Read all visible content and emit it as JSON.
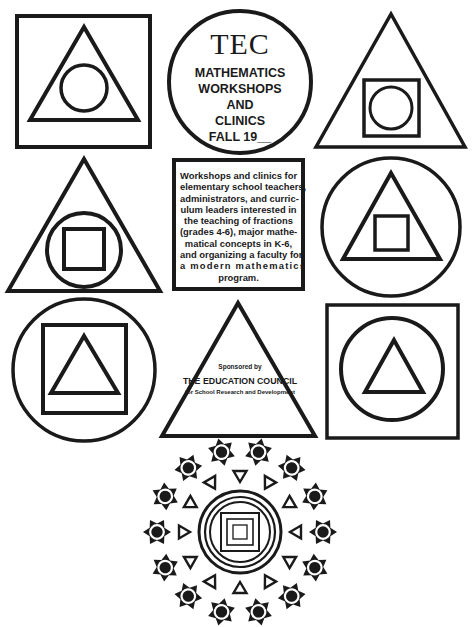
{
  "title": {
    "org_short": "TEC",
    "lines": [
      "MATHEMATICS",
      "WORKSHOPS",
      "AND",
      "CLINICS",
      "FALL 19__"
    ]
  },
  "description": {
    "lines": [
      "Workshops and clinics for",
      "elementary school teachers,",
      "administrators, and curric-",
      "ulum leaders interested in",
      "the teaching of fractions",
      "(grades 4-6), major mathe-",
      "matical concepts in K-6,",
      "and organizing a faculty for",
      "a modern mathematics",
      "program."
    ]
  },
  "sponsor": {
    "label": "Sponsored by",
    "organization": "THE EDUCATION COUNCIL",
    "subtitle": "for School Research and Development"
  },
  "figures": [
    {
      "position": "top-left",
      "nesting": [
        "square",
        "triangle",
        "circle"
      ]
    },
    {
      "position": "top-center",
      "nesting": [
        "circle"
      ],
      "contains": "title"
    },
    {
      "position": "top-right",
      "nesting": [
        "triangle",
        "square",
        "circle"
      ]
    },
    {
      "position": "middle-left",
      "nesting": [
        "triangle",
        "circle",
        "square"
      ]
    },
    {
      "position": "middle-center",
      "nesting": [
        "square"
      ],
      "contains": "description"
    },
    {
      "position": "middle-right",
      "nesting": [
        "circle",
        "triangle",
        "square"
      ]
    },
    {
      "position": "bottom-left",
      "nesting": [
        "circle",
        "square",
        "triangle"
      ]
    },
    {
      "position": "bottom-center",
      "nesting": [
        "triangle"
      ],
      "contains": "sponsor"
    },
    {
      "position": "bottom-right",
      "nesting": [
        "square",
        "circle",
        "triangle"
      ]
    }
  ],
  "mandala": {
    "star_count": 14,
    "triangle_count": 12,
    "rings": 3,
    "nested_squares": 3
  },
  "colors": {
    "ink": "#1a1a1a",
    "paper": "#ffffff"
  }
}
